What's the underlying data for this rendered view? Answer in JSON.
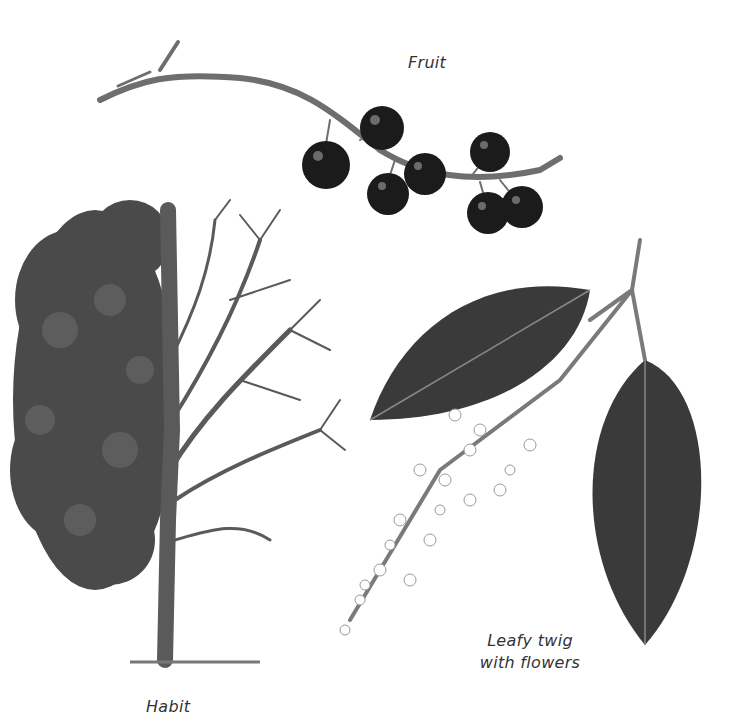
{
  "illustration": {
    "labels": {
      "fruit": "Fruit",
      "leafy_line1": "Leafy twig",
      "leafy_line2": "with flowers",
      "habit": "Habit"
    },
    "colors": {
      "background": "#ffffff",
      "branch": "#6e6e6e",
      "berry": "#1b1b1b",
      "foliage": "#4a4a4a",
      "leaf": "#3a3a3a",
      "flower": "#d9d9d9",
      "label": "#333333"
    }
  }
}
